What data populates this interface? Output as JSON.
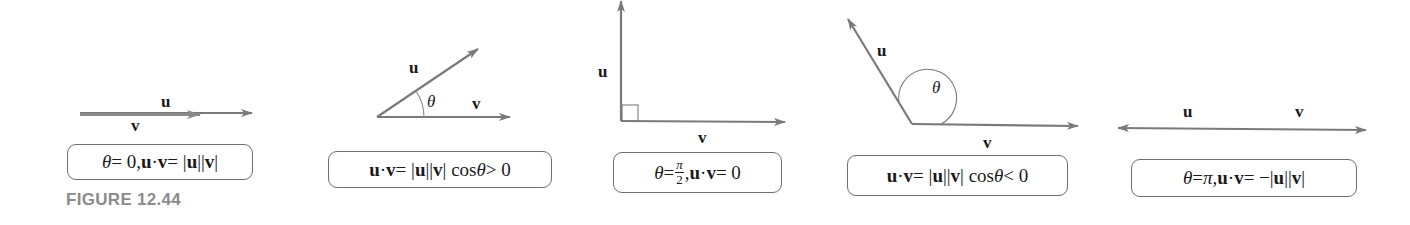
{
  "figure": {
    "caption": "FIGURE 12.44",
    "line_color": "#7a7a7a",
    "text_color": "#1a1a1a",
    "caption_color": "#8c8c8c"
  },
  "panels": [
    {
      "id": "theta-zero",
      "labels": {
        "u": "u",
        "v": "v"
      },
      "formula": {
        "theta": "θ",
        "eq1": " = 0,  ",
        "u": "u",
        "dot": " · ",
        "v": "v",
        "eq2": " = |",
        "u2": "u",
        "mid": "||",
        "v2": "v",
        "end": "|"
      }
    },
    {
      "id": "theta-acute",
      "labels": {
        "u": "u",
        "v": "v",
        "theta": "θ"
      },
      "formula": {
        "u": "u",
        "dot": " · ",
        "v": "v",
        "eq": " = |",
        "u2": "u",
        "mid": "||",
        "v2": "v",
        "cos": "| cos ",
        "theta": "θ",
        "end": " > 0"
      }
    },
    {
      "id": "theta-right",
      "labels": {
        "u": "u",
        "v": "v"
      },
      "formula": {
        "theta": "θ",
        "eq1": " = ",
        "num": "π",
        "den": "2",
        "comma": ",  ",
        "u": "u",
        "dot": " · ",
        "v": "v",
        "end": " = 0"
      }
    },
    {
      "id": "theta-obtuse",
      "labels": {
        "u": "u",
        "v": "v",
        "theta": "θ"
      },
      "formula": {
        "u": "u",
        "dot": " · ",
        "v": "v",
        "eq": " = |",
        "u2": "u",
        "mid": "||",
        "v2": "v",
        "cos": "| cos ",
        "theta": "θ",
        "end": " < 0"
      }
    },
    {
      "id": "theta-pi",
      "labels": {
        "u": "u",
        "v": "v"
      },
      "formula": {
        "theta": "θ",
        "eq1": " = ",
        "pi": "π",
        "comma": ",  ",
        "u": "u",
        "dot": " · ",
        "v": "v",
        "eq2": " = −|",
        "u2": "u",
        "mid": "||",
        "v2": "v",
        "end": "|"
      }
    }
  ]
}
